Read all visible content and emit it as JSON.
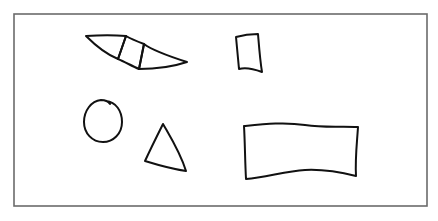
{
  "canvas": {
    "width": 438,
    "height": 221,
    "background": "#ffffff"
  },
  "frame": {
    "x": 14,
    "y": 14,
    "width": 413,
    "height": 192,
    "stroke": "#6b6b6b"
  },
  "shapes": [
    {
      "id": "bowtie",
      "kind": "bowtie",
      "stroke": "#111111"
    },
    {
      "id": "small-quad",
      "kind": "quadrilateral",
      "stroke": "#111111"
    },
    {
      "id": "circle",
      "kind": "circle",
      "stroke": "#111111"
    },
    {
      "id": "triangle",
      "kind": "triangle",
      "stroke": "#111111"
    },
    {
      "id": "rectangle",
      "kind": "rectangle",
      "stroke": "#111111"
    }
  ]
}
